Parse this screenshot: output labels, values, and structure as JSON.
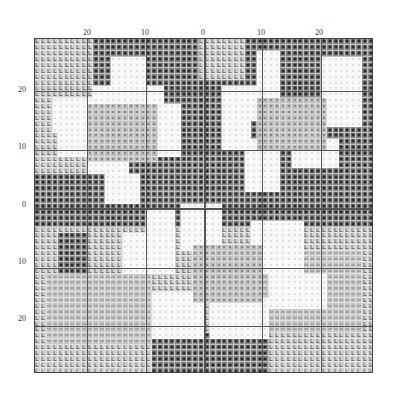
{
  "chart_data": {
    "type": "heatmap",
    "title": "",
    "grid": {
      "cols": 58,
      "rows": 57,
      "center_col": 29,
      "center_row": 29
    },
    "x_tick_labels": [
      "20",
      "10",
      "0",
      "10",
      "20"
    ],
    "y_tick_labels": [
      "20",
      "10",
      "0",
      "10",
      "20"
    ],
    "legend": [
      {
        "symbol": "dark-square",
        "tone": "dark gray background"
      },
      {
        "symbol": "white-dot",
        "tone": "white petals"
      },
      {
        "symbol": "mid-dot",
        "tone": "mid gray flower centers"
      },
      {
        "symbol": "L-mark",
        "tone": "light gray background"
      },
      {
        "symbol": "wave-mark",
        "tone": "light gray leaves"
      }
    ],
    "regions": [
      {
        "tone": "light",
        "rect": [
          0,
          0,
          10,
          23
        ]
      },
      {
        "tone": "light",
        "rect": [
          28,
          0,
          36,
          7
        ]
      },
      {
        "tone": "light",
        "rect": [
          0,
          32,
          58,
          57
        ]
      },
      {
        "tone": "wave",
        "rect": [
          2,
          40,
          20,
          52
        ]
      },
      {
        "tone": "wave",
        "rect": [
          38,
          36,
          56,
          50
        ]
      },
      {
        "tone": "dark",
        "rect": [
          20,
          50,
          40,
          57
        ]
      },
      {
        "tone": "dark",
        "rect": [
          4,
          33,
          9,
          40
        ]
      },
      {
        "tone": "white",
        "rect": [
          13,
          3,
          19,
          8
        ]
      },
      {
        "tone": "white",
        "rect": [
          10,
          8,
          22,
          14
        ]
      },
      {
        "tone": "white",
        "rect": [
          3,
          10,
          11,
          16
        ]
      },
      {
        "tone": "white",
        "rect": [
          4,
          16,
          10,
          20
        ]
      },
      {
        "tone": "white",
        "rect": [
          9,
          19,
          16,
          23
        ]
      },
      {
        "tone": "white",
        "rect": [
          12,
          23,
          18,
          28
        ]
      },
      {
        "tone": "white",
        "rect": [
          21,
          11,
          25,
          20
        ]
      },
      {
        "tone": "mid",
        "rect": [
          9,
          11,
          21,
          21
        ]
      },
      {
        "tone": "white",
        "rect": [
          38,
          2,
          42,
          12
        ]
      },
      {
        "tone": "white",
        "rect": [
          32,
          8,
          40,
          14
        ]
      },
      {
        "tone": "white",
        "rect": [
          49,
          3,
          56,
          10
        ]
      },
      {
        "tone": "white",
        "rect": [
          47,
          10,
          56,
          15
        ]
      },
      {
        "tone": "white",
        "rect": [
          44,
          17,
          52,
          22
        ]
      },
      {
        "tone": "white",
        "rect": [
          36,
          17,
          42,
          26
        ]
      },
      {
        "tone": "white",
        "rect": [
          32,
          14,
          37,
          19
        ]
      },
      {
        "tone": "mid",
        "rect": [
          38,
          10,
          50,
          19
        ]
      },
      {
        "tone": "white",
        "rect": [
          25,
          28,
          32,
          36
        ]
      },
      {
        "tone": "white",
        "rect": [
          19,
          29,
          24,
          33
        ]
      },
      {
        "tone": "white",
        "rect": [
          15,
          33,
          24,
          40
        ]
      },
      {
        "tone": "white",
        "rect": [
          37,
          31,
          46,
          40
        ]
      },
      {
        "tone": "white",
        "rect": [
          40,
          40,
          50,
          46
        ]
      },
      {
        "tone": "white",
        "rect": [
          20,
          43,
          29,
          51
        ]
      },
      {
        "tone": "white",
        "rect": [
          30,
          44,
          40,
          51
        ]
      },
      {
        "tone": "mid",
        "rect": [
          27,
          35,
          39,
          45
        ]
      }
    ]
  }
}
